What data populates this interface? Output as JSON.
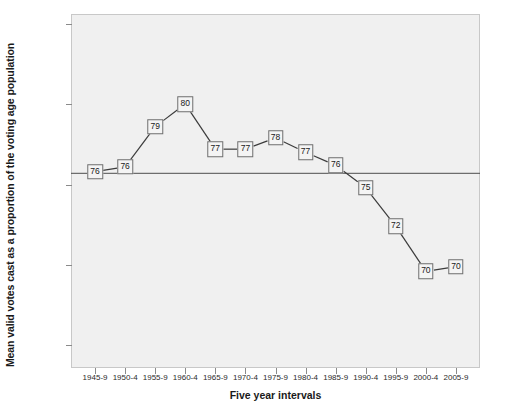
{
  "chart_data": {
    "type": "line",
    "title": "",
    "xlabel": "Five year intervals",
    "ylabel": "Mean valid votes cast as a proportion of the voting age population",
    "categories": [
      "1945-9",
      "1950-4",
      "1955-9",
      "1960-4",
      "1965-9",
      "1970-4",
      "1975-9",
      "1980-4",
      "1985-9",
      "1990-4",
      "1995-9",
      "2000-4",
      "2005-9"
    ],
    "values": [
      75.8,
      76.1,
      78.6,
      80.0,
      77.2,
      77.2,
      77.9,
      77.0,
      76.2,
      74.8,
      72.4,
      69.6,
      69.9
    ],
    "point_labels": [
      "76",
      "76",
      "79",
      "80",
      "77",
      "77",
      "78",
      "77",
      "76",
      "75",
      "72",
      "70",
      "70"
    ],
    "ylim": [
      63.6,
      85.6
    ],
    "y_ticks": [
      "85.0",
      "80.0",
      "75.0",
      "70.0",
      "65.0"
    ],
    "y_tick_values": [
      85.0,
      80.0,
      75.0,
      70.0,
      65.0
    ],
    "reference_line": {
      "value": 75.7,
      "label": ""
    },
    "grid": false,
    "legend": "none",
    "colors": {
      "plot_background": "#f0f0f0",
      "line": "#3b3b3b",
      "marker_border": "#6e6e6e",
      "marker_fill": "#f4f4f4",
      "axis": "#8a8a8a",
      "reference_line": "#4d4d4d",
      "text": "#1a1a1a"
    }
  }
}
